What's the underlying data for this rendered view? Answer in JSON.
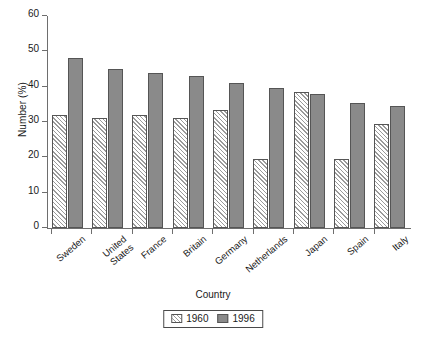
{
  "chart_data": {
    "type": "bar",
    "title": "",
    "xlabel": "Country",
    "ylabel": "Number (%)",
    "ylim": [
      0,
      60
    ],
    "yticks": [
      0,
      10,
      20,
      30,
      40,
      50,
      60
    ],
    "grid": false,
    "legend_position": "bottom-center",
    "categories": [
      "Sweden",
      "United States",
      "France",
      "Britain",
      "Germany",
      "Netherlands",
      "Japan",
      "Spain",
      "Italy"
    ],
    "series": [
      {
        "name": "1960",
        "fill": "diagonal-hatch",
        "values": [
          32,
          31,
          32,
          31,
          33.5,
          19.5,
          38.5,
          19.5,
          29.5
        ]
      },
      {
        "name": "1996",
        "fill": "solid-gray",
        "color": "#8a8a8a",
        "values": [
          48,
          45,
          44,
          43,
          41,
          39.5,
          38,
          35.5,
          34.5
        ]
      }
    ]
  },
  "legend": {
    "items": [
      {
        "label": "1960"
      },
      {
        "label": "1996"
      }
    ]
  }
}
